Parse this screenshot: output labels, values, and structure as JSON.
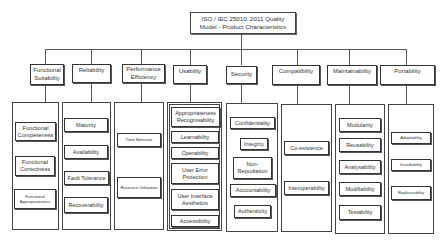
{
  "title": "ISO / IEC 25010: 2011 Quality Model - Product Characteristics",
  "characteristics": [
    {
      "label": "Functional Suitability",
      "subs": [
        "Functional Completeness",
        "Functional Correctness",
        "Functional Appropriateness"
      ]
    },
    {
      "label": "Reliability",
      "subs": [
        "Maturity",
        "Availability",
        "Fault Tolerance",
        "Recoverability"
      ]
    },
    {
      "label": "Performance Efficiency",
      "subs": [
        "Time Behavior",
        "Resource Utilization"
      ]
    },
    {
      "label": "Usability",
      "subs": [
        "Appropriateness Recognisability",
        "Learnability",
        "Operability",
        "User Error Protection",
        "User Interface Aesthetics",
        "Accessibility"
      ]
    },
    {
      "label": "Security",
      "subs": [
        "Confidentiality",
        "Integrity",
        "Non-Repudiation",
        "Accountability",
        "Authenticity"
      ]
    },
    {
      "label": "Compatibility",
      "subs": [
        "Co-existence",
        "Interoperability"
      ]
    },
    {
      "label": "Maintainability",
      "subs": [
        "Modularity",
        "Reusability",
        "Analysability",
        "Modifiability",
        "Testability"
      ]
    },
    {
      "label": "Portability",
      "subs": [
        "Adaptability",
        "Installability",
        "Replaceability"
      ]
    }
  ]
}
